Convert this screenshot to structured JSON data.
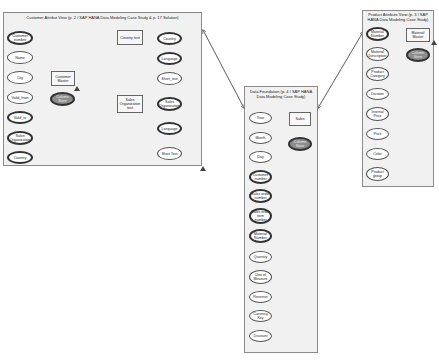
{
  "customer_view": {
    "title": "Customer Attribut View (p. 2 / SAP HANA Data Modeling Case Study & p. 17 Solution)",
    "attributes": [
      "Customer number",
      "Name",
      "City",
      "Valid_from",
      "Valid_to",
      "Sales Organization",
      "Country"
    ],
    "master": "Customer Master",
    "store": "Column Store",
    "country_text": {
      "label": "Country text",
      "attributes": [
        "Country",
        "Language",
        "Short_text"
      ]
    },
    "sales_org_text": {
      "label": "Sales Organization text",
      "attributes": [
        "Sales Organization",
        "Language",
        "Short Text"
      ]
    }
  },
  "data_foundation": {
    "title": "Data Foundation (p. 4 / SAP HANA Data Modeling Case Study)",
    "table": "Sales",
    "store": "Column Store",
    "attributes": [
      "Year",
      "Month",
      "Day",
      "Customer number",
      "Sales order number",
      "Sales order item number",
      "Material Number",
      "Quantity",
      "Unit of Measure",
      "Revenue",
      "Currency Key",
      "Discount"
    ]
  },
  "product_view": {
    "title": "Product Attribute View (p. 3 / SAP HANA Data Modeling Case Study)",
    "master": "Material Master",
    "store": "Column Store",
    "attributes": [
      "Material Number",
      "Material Description",
      "Product Category",
      "Division",
      "Internal Price",
      "Price",
      "Color",
      "Product group"
    ]
  }
}
